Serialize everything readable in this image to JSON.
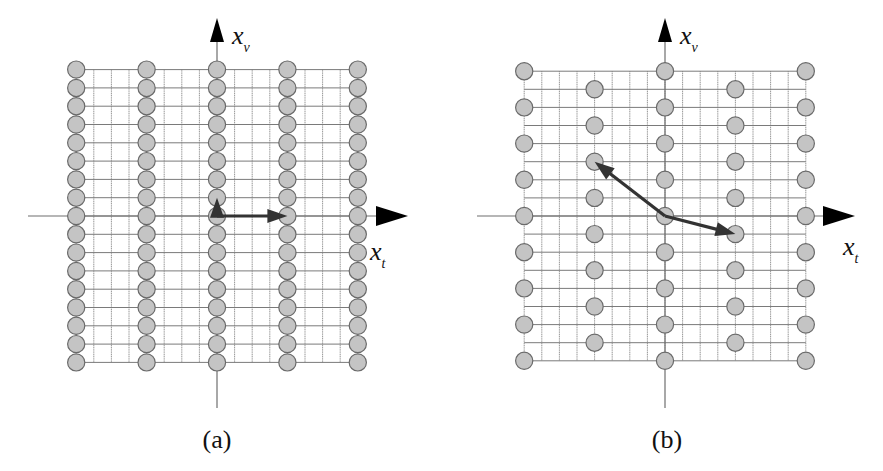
{
  "figure": {
    "colors": {
      "point_fill": "#c4c4c4",
      "point_stroke": "#6a6a6a",
      "grid": "#8a8a8a",
      "axis": "#6e6e6e",
      "arrow": "#333333",
      "arrowhead": "#000000"
    },
    "panels": [
      {
        "id": "a",
        "caption": "(a)",
        "x_axis_label": "x",
        "x_axis_subscript": "t",
        "y_axis_label": "x",
        "y_axis_subscript": "v",
        "lattice_type": "rectangular",
        "origin": [
          217,
          216
        ],
        "step_x": 17.6,
        "step_y": 18.3,
        "grid_cols": [
          -8,
          8
        ],
        "grid_rows": [
          -8,
          8
        ],
        "point_columns": [
          -8,
          -4,
          0,
          4,
          8
        ],
        "point_row_rule": "all",
        "basis_vectors": [
          {
            "to": [
              0,
              -1
            ]
          },
          {
            "to": [
              4,
              0
            ]
          }
        ],
        "h_axis": {
          "x1": 28,
          "x2": 408
        },
        "v_axis": {
          "y1": 18,
          "y2": 408
        },
        "x_label_pos": [
          370,
          260
        ],
        "y_label_pos": [
          232,
          44
        ],
        "caption_pos": [
          217,
          448
        ]
      },
      {
        "id": "b",
        "caption": "(b)",
        "x_axis_label": "x",
        "x_axis_subscript": "t",
        "y_axis_label": "x",
        "y_axis_subscript": "v",
        "lattice_type": "quincunx",
        "origin": [
          665,
          216
        ],
        "step_x": 17.6,
        "step_y": 18.1,
        "grid_cols": [
          -8,
          8
        ],
        "grid_rows": [
          -8,
          8
        ],
        "point_columns": [
          -8,
          -4,
          0,
          4,
          8
        ],
        "point_row_rule": "parity",
        "basis_vectors": [
          {
            "to": [
              -4,
              -3
            ]
          },
          {
            "to": [
              4,
              1
            ]
          }
        ],
        "h_axis": {
          "x1": 477,
          "x2": 855
        },
        "v_axis": {
          "y1": 18,
          "y2": 408
        },
        "x_label_pos": [
          843,
          255
        ],
        "y_label_pos": [
          680,
          44
        ],
        "caption_pos": [
          667,
          448
        ]
      }
    ]
  }
}
